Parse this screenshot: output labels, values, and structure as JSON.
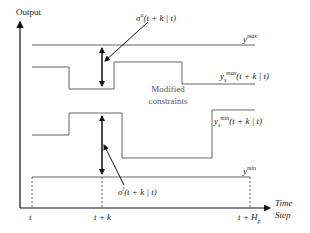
{
  "diagram": {
    "y_axis_label": "Output",
    "x_axis_label_line1": "Time",
    "x_axis_label_line2": "Step",
    "ticks": {
      "t": "t",
      "t_plus_k": "t + k",
      "t_plus_Hp_main": "t + H",
      "t_plus_Hp_sub": "p"
    },
    "y_max": {
      "base": "y",
      "sup": "max"
    },
    "y_min": {
      "base": "y",
      "sup": "min"
    },
    "ys_max": {
      "base": "y",
      "sup": "max",
      "sub": "s",
      "arg": "(t + k | t)"
    },
    "ys_min": {
      "base": "y",
      "sup": "min",
      "sub": "s",
      "arg": "(t + k | t)"
    },
    "sigma_u": {
      "base": "σ",
      "sup": "u",
      "arg": "(t + k | t)"
    },
    "sigma_l": {
      "base": "σ",
      "sup": "l",
      "arg": "(t + k | t)"
    },
    "center_text_line1": "Modified",
    "center_text_line2": "constraints",
    "colors": {
      "axis": "#111111",
      "constraint_line": "#666666",
      "text": "#222222",
      "annotation": "#777777"
    }
  }
}
